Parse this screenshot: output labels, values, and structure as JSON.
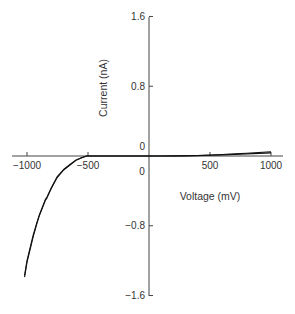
{
  "chart_data": {
    "type": "line",
    "title": "",
    "xlabel": "Voltage (mV)",
    "ylabel": "Current (nA)",
    "xlim": [
      -1020,
      1000
    ],
    "ylim": [
      -1.6,
      1.6
    ],
    "x_ticks": [
      -1000,
      -500,
      0,
      500,
      1000
    ],
    "x_tick_labels": [
      "−1000",
      "−500",
      "0",
      "500",
      "1000"
    ],
    "y_ticks": [
      1.6,
      0.8,
      0,
      -0.8,
      -1.6
    ],
    "y_tick_labels": [
      "1.6",
      "0.8",
      "0",
      "−0.8",
      "−1.6"
    ],
    "grid": false,
    "legend": null,
    "axes_style": "crossing at origin",
    "series": [
      {
        "name": "trace 1",
        "x": [
          -1020,
          -1000,
          -950,
          -918,
          -900,
          -850,
          -836,
          -800,
          -754,
          -700,
          -645,
          -600,
          -550,
          -511,
          -500,
          -400,
          -300,
          -200,
          -100,
          0,
          100,
          200,
          300,
          400,
          500,
          600,
          700,
          800,
          900,
          1000
        ],
        "y": [
          -1.39,
          -1.22,
          -0.93,
          -0.77,
          -0.69,
          -0.51,
          -0.48,
          -0.37,
          -0.25,
          -0.16,
          -0.1,
          -0.05,
          -0.02,
          0.0,
          0.0,
          0.0,
          0.0,
          0.0,
          0.0,
          0.0,
          0.0,
          0.0,
          0.002,
          0.004,
          0.008,
          0.013,
          0.018,
          0.024,
          0.03,
          0.036
        ]
      },
      {
        "name": "trace 2",
        "x": [
          -1020,
          -1000,
          -950,
          -918,
          -900,
          -850,
          -836,
          -800,
          -754,
          -700,
          -645,
          -600,
          -550,
          -511,
          -500,
          -400,
          -300,
          -200,
          -100,
          0,
          100,
          200,
          300,
          400,
          500,
          600,
          700,
          800,
          900,
          1000
        ],
        "y": [
          -1.37,
          -1.2,
          -0.91,
          -0.76,
          -0.68,
          -0.5,
          -0.47,
          -0.36,
          -0.24,
          -0.155,
          -0.095,
          -0.048,
          -0.018,
          0.0,
          0.0,
          0.0,
          0.0,
          0.0,
          0.0,
          0.0,
          0.0,
          0.001,
          0.003,
          0.006,
          0.011,
          0.017,
          0.024,
          0.032,
          0.04,
          0.048
        ]
      }
    ]
  },
  "layout": {
    "x_axis_line": [
      12,
      283
    ],
    "y_axis_line": [
      17,
      296
    ],
    "origin_px": [
      149,
      156
    ],
    "x_px_per_mV": 0.122,
    "y_px_per_nA": 87.2,
    "line_color": "#111111",
    "axis_color": "#444444",
    "text_color": "#333333"
  }
}
